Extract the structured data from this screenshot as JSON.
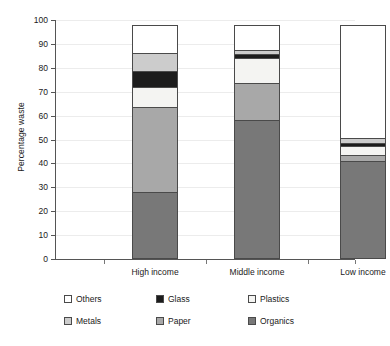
{
  "chart_data": {
    "type": "bar",
    "subtype": "stacked-bar",
    "title": "",
    "xlabel": "",
    "ylabel": "Percentage waste",
    "ylim": [
      0,
      100
    ],
    "yticks": [
      0,
      10,
      20,
      30,
      40,
      50,
      60,
      70,
      80,
      90,
      100
    ],
    "ytick_labels": [
      "0",
      "10",
      "20",
      "30",
      "40",
      "50",
      "60",
      "70",
      "80",
      "90",
      "100"
    ],
    "grid": true,
    "legend_position": "bottom",
    "categories": [
      "High income",
      "Middle income",
      "Low income"
    ],
    "stack_order_bottom_to_top": [
      "Organics",
      "Paper",
      "Plastics",
      "Glass",
      "Metals",
      "Others"
    ],
    "series": [
      {
        "name": "Organics",
        "color": "#787878",
        "values": [
          28,
          58,
          41
        ]
      },
      {
        "name": "Plastics",
        "color": "#f4f4f2",
        "values": [
          9,
          11,
          4
        ]
      },
      {
        "name": "Paper",
        "color": "#a8a8a8",
        "values": [
          36,
          16,
          3
        ]
      },
      {
        "name": "Glass",
        "color": "#1c1c1c",
        "values": [
          7,
          2,
          2
        ]
      },
      {
        "name": "Metals",
        "color": "#cccccc",
        "values": [
          8,
          2,
          2.5
        ]
      },
      {
        "name": "Others",
        "color": "#ffffff",
        "values": [
          12,
          11,
          47.5
        ]
      }
    ],
    "cumulative_tops": {
      "High income": {
        "Organics": 28,
        "Plastics": 37,
        "Paper": 73,
        "Glass": 80,
        "Metals": 88,
        "Others": 100
      },
      "Middle income": {
        "Organics": 58,
        "Plastics": 69,
        "Paper": 85,
        "Glass": 87,
        "Metals": 89,
        "Others": 100
      },
      "Low income": {
        "Organics": 41,
        "Plastics": 45,
        "Paper": 48,
        "Glass": 50,
        "Metals": 52.5,
        "Others": 100
      }
    }
  },
  "legend": {
    "entries": [
      {
        "label": "Others",
        "swatch": "others-swatch"
      },
      {
        "label": "Glass",
        "swatch": "glass-swatch"
      },
      {
        "label": "Plastics",
        "swatch": "plastics-swatch"
      },
      {
        "label": "Metals",
        "swatch": "metals-swatch"
      },
      {
        "label": "Paper",
        "swatch": "paper-swatch"
      },
      {
        "label": "Organics",
        "swatch": "organics-swatch"
      }
    ]
  }
}
